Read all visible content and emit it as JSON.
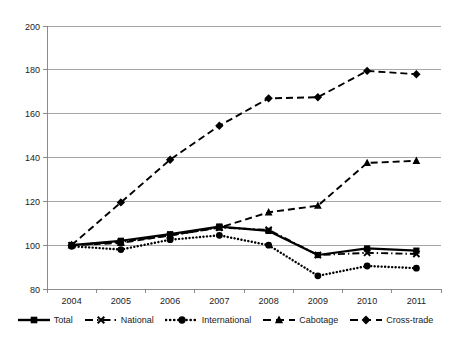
{
  "chart_data": {
    "type": "line",
    "title": "",
    "xlabel": "",
    "ylabel": "",
    "categories": [
      "2004",
      "2005",
      "2006",
      "2007",
      "2008",
      "2009",
      "2010",
      "2011"
    ],
    "x": [
      2004,
      2005,
      2006,
      2007,
      2008,
      2009,
      2010,
      2011
    ],
    "ylim": [
      80,
      200
    ],
    "yticks": [
      80,
      100,
      120,
      140,
      160,
      180,
      200
    ],
    "grid": true,
    "legend_position": "bottom",
    "series": [
      {
        "name": "Total",
        "values": [
          100,
          102,
          105,
          108.5,
          106.5,
          95.5,
          98.5,
          97.5
        ],
        "marker": "square",
        "line_style": "solid",
        "color": "#000000"
      },
      {
        "name": "National",
        "values": [
          100,
          101.5,
          104.5,
          108,
          107,
          95.5,
          96.5,
          96
        ],
        "marker": "x",
        "line_style": "dash-dot",
        "color": "#000000"
      },
      {
        "name": "International",
        "values": [
          99.5,
          98,
          102.5,
          104.5,
          100,
          86,
          90.5,
          89.5
        ],
        "marker": "circle",
        "line_style": "dotted",
        "color": "#000000"
      },
      {
        "name": "Cabotage",
        "values": [
          100,
          101,
          104.5,
          108,
          115,
          118,
          137.5,
          138.5
        ],
        "marker": "triangle",
        "line_style": "dashed",
        "color": "#000000"
      },
      {
        "name": "Cross-trade",
        "values": [
          100,
          119.5,
          139,
          154.5,
          167,
          167.5,
          179.5,
          178
        ],
        "marker": "diamond",
        "line_style": "dashed",
        "color": "#000000"
      }
    ]
  },
  "axis": {
    "y_tick_labels": [
      "200",
      "180",
      "160",
      "140",
      "120",
      "100",
      "80"
    ],
    "x_tick_labels": [
      "2004",
      "2005",
      "2006",
      "2007",
      "2008",
      "2009",
      "2010",
      "2011"
    ]
  },
  "legend": {
    "items": [
      {
        "label": "Total"
      },
      {
        "label": "National"
      },
      {
        "label": "International"
      },
      {
        "label": "Cabotage"
      },
      {
        "label": "Cross-trade"
      }
    ]
  },
  "style": {
    "grid_color": "#808080",
    "axis_color": "#7f7f7f",
    "series_color": "#000000",
    "background": "#ffffff"
  }
}
